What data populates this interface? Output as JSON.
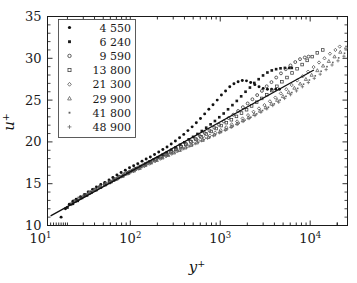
{
  "chart_data": {
    "type": "scatter",
    "title": "",
    "xlabel": "y+",
    "ylabel": "u+",
    "xscale": "log",
    "yscale": "linear",
    "xlim": [
      12,
      26000
    ],
    "ylim": [
      10,
      35
    ],
    "grid": false,
    "legend_position": "upper-left",
    "legend_title": "",
    "xticks": [
      10,
      100,
      1000,
      10000
    ],
    "xticklabels": [
      "10^1",
      "10^2",
      "10^3",
      "10^4"
    ],
    "yticks": [
      10,
      15,
      20,
      25,
      30,
      35
    ],
    "yticklabels": [
      "10",
      "15",
      "20",
      "25",
      "30",
      "35"
    ],
    "annotations": [
      {
        "name": "log-law-line",
        "description": "straight reference line",
        "x_start": 13,
        "y_start": 11.15,
        "x_end": 11000,
        "y_end": 28.6
      }
    ],
    "series": [
      {
        "name": "4 550",
        "marker": "filled-circle",
        "color": "#111111",
        "x": [
          17,
          19,
          21,
          23,
          25,
          28,
          31,
          34,
          38,
          42,
          47,
          52,
          58,
          64,
          71,
          79,
          88,
          98,
          109,
          121,
          135,
          150,
          167,
          186,
          207,
          230,
          256,
          285,
          317,
          353,
          393,
          437,
          487,
          542,
          603,
          671,
          747,
          831,
          925,
          1030,
          1146,
          1276,
          1420,
          1580,
          1759,
          1958,
          2179,
          2425,
          2699,
          3004,
          3344,
          3722,
          4143,
          4550
        ],
        "y": [
          11.0,
          12.0,
          12.55,
          12.9,
          13.15,
          13.45,
          13.7,
          14.0,
          14.3,
          14.6,
          14.9,
          15.15,
          15.45,
          15.75,
          16.05,
          16.35,
          16.6,
          16.9,
          17.15,
          17.4,
          17.7,
          17.95,
          18.2,
          18.5,
          18.8,
          19.1,
          19.4,
          19.75,
          20.1,
          20.5,
          20.9,
          21.35,
          21.8,
          22.3,
          22.8,
          23.35,
          23.9,
          24.45,
          25.0,
          25.6,
          26.1,
          26.6,
          26.95,
          27.2,
          27.35,
          27.3,
          27.1,
          26.85,
          26.6,
          26.4,
          26.3,
          26.3,
          26.3,
          26.3
        ]
      },
      {
        "name": "6 240",
        "marker": "filled-square",
        "color": "#1a1a1a",
        "x": [
          20,
          23,
          26,
          29,
          33,
          37,
          42,
          47,
          53,
          59,
          66,
          74,
          83,
          93,
          104,
          116,
          130,
          146,
          163,
          182,
          204,
          228,
          255,
          285,
          319,
          357,
          399,
          446,
          499,
          558,
          624,
          698,
          781,
          873,
          976,
          1092,
          1221,
          1366,
          1528,
          1709,
          1911,
          2138,
          2391,
          2674,
          2991,
          3345,
          3741,
          4184,
          4680,
          5234,
          5854,
          6240
        ],
        "y": [
          12.15,
          12.6,
          12.95,
          13.3,
          13.6,
          13.95,
          14.25,
          14.55,
          14.85,
          15.1,
          15.4,
          15.7,
          16.0,
          16.3,
          16.55,
          16.85,
          17.1,
          17.35,
          17.65,
          17.9,
          18.15,
          18.45,
          18.75,
          19.05,
          19.35,
          19.65,
          19.95,
          20.3,
          20.6,
          20.95,
          21.3,
          21.7,
          22.1,
          22.5,
          22.95,
          23.4,
          23.9,
          24.4,
          24.9,
          25.45,
          26.0,
          26.5,
          27.05,
          27.5,
          27.95,
          28.3,
          28.55,
          28.7,
          28.8,
          28.85,
          28.85,
          28.85
        ]
      },
      {
        "name": "9 590",
        "marker": "open-circle",
        "color": "#2b2b2b",
        "x": [
          22,
          25,
          28,
          32,
          36,
          41,
          46,
          52,
          59,
          66,
          75,
          85,
          96,
          108,
          122,
          138,
          156,
          176,
          199,
          225,
          254,
          287,
          324,
          366,
          413,
          467,
          527,
          596,
          673,
          760,
          859,
          970,
          1096,
          1238,
          1399,
          1580,
          1785,
          2017,
          2278,
          2574,
          2907,
          3284,
          3710,
          4191,
          4734,
          5348,
          6041,
          6824,
          7709,
          8708,
          9590
        ],
        "y": [
          12.55,
          12.95,
          13.3,
          13.65,
          13.95,
          14.3,
          14.6,
          14.9,
          15.2,
          15.5,
          15.8,
          16.1,
          16.35,
          16.65,
          16.95,
          17.2,
          17.5,
          17.75,
          18.05,
          18.3,
          18.6,
          18.9,
          19.2,
          19.5,
          19.8,
          20.1,
          20.4,
          20.7,
          21.05,
          21.35,
          21.7,
          22.05,
          22.45,
          22.85,
          23.25,
          23.7,
          24.15,
          24.6,
          25.1,
          25.6,
          26.1,
          26.65,
          27.15,
          27.7,
          28.2,
          28.7,
          29.15,
          29.55,
          29.9,
          30.1,
          30.2
        ]
      },
      {
        "name": "13 800",
        "marker": "open-square",
        "color": "#3a3a3a",
        "x": [
          24,
          27,
          31,
          35,
          40,
          46,
          52,
          59,
          68,
          77,
          88,
          100,
          114,
          130,
          148,
          168,
          191,
          218,
          248,
          282,
          321,
          365,
          415,
          473,
          538,
          612,
          697,
          793,
          902,
          1027,
          1169,
          1330,
          1514,
          1723,
          1961,
          2232,
          2540,
          2891,
          3290,
          3745,
          4262,
          4851,
          5521,
          6283,
          7151,
          8139,
          9264,
          10543,
          12000,
          13800
        ],
        "y": [
          12.9,
          13.25,
          13.6,
          13.95,
          14.3,
          14.6,
          14.95,
          15.25,
          15.55,
          15.85,
          16.15,
          16.45,
          16.75,
          17.05,
          17.35,
          17.6,
          17.9,
          18.2,
          18.5,
          18.8,
          19.1,
          19.4,
          19.7,
          20.0,
          20.3,
          20.6,
          20.95,
          21.25,
          21.6,
          21.95,
          22.3,
          22.65,
          23.05,
          23.45,
          23.85,
          24.3,
          24.75,
          25.2,
          25.65,
          26.15,
          26.65,
          27.2,
          27.7,
          28.25,
          28.75,
          29.25,
          29.75,
          30.2,
          30.65,
          31.0
        ]
      },
      {
        "name": "21 300",
        "marker": "open-diamond",
        "color": "#4a4a4a",
        "x": [
          27,
          31,
          36,
          41,
          47,
          54,
          62,
          71,
          82,
          94,
          108,
          124,
          143,
          164,
          189,
          217,
          250,
          287,
          330,
          380,
          437,
          503,
          578,
          665,
          765,
          880,
          1012,
          1164,
          1339,
          1540,
          1771,
          2037,
          2343,
          2695,
          3100,
          3565,
          4100,
          4715,
          5423,
          6236,
          7171,
          8247,
          9484,
          10907,
          12543,
          14424,
          16588,
          19076,
          21300
        ],
        "y": [
          13.2,
          13.6,
          13.95,
          14.3,
          14.6,
          14.95,
          15.25,
          15.55,
          15.9,
          16.2,
          16.5,
          16.8,
          17.1,
          17.4,
          17.7,
          18.0,
          18.3,
          18.6,
          18.9,
          19.2,
          19.5,
          19.8,
          20.1,
          20.45,
          20.75,
          21.1,
          21.4,
          21.75,
          22.1,
          22.45,
          22.8,
          23.2,
          23.6,
          24.0,
          24.4,
          24.85,
          25.3,
          25.8,
          26.3,
          26.8,
          27.35,
          27.85,
          28.4,
          28.95,
          29.5,
          30.0,
          30.55,
          31.0,
          31.4
        ]
      },
      {
        "name": "29 900",
        "marker": "open-triangle",
        "color": "#555555",
        "x": [
          30,
          35,
          40,
          46,
          53,
          61,
          71,
          82,
          95,
          110,
          127,
          147,
          170,
          197,
          228,
          264,
          306,
          354,
          410,
          475,
          550,
          637,
          738,
          855,
          990,
          1147,
          1328,
          1538,
          1781,
          2063,
          2389,
          2767,
          3205,
          3712,
          4299,
          4979,
          5766,
          6678,
          7734,
          8958,
          10375,
          12016,
          13917,
          16118,
          18668,
          21622,
          25044,
          29900
        ],
        "y": [
          13.5,
          13.9,
          14.25,
          14.6,
          14.95,
          15.25,
          15.6,
          15.9,
          16.25,
          16.55,
          16.85,
          17.2,
          17.5,
          17.8,
          18.1,
          18.4,
          18.7,
          19.0,
          19.3,
          19.6,
          19.9,
          20.2,
          20.55,
          20.85,
          21.2,
          21.5,
          21.85,
          22.2,
          22.55,
          22.9,
          23.3,
          23.7,
          24.1,
          24.55,
          25.0,
          25.45,
          25.95,
          26.45,
          26.95,
          27.5,
          28.0,
          28.55,
          29.1,
          29.65,
          30.2,
          30.75,
          31.3,
          32.1
        ]
      },
      {
        "name": "41 800",
        "marker": "small-dot",
        "color": "#606060",
        "x": [
          33,
          38,
          44,
          51,
          59,
          69,
          80,
          93,
          108,
          126,
          146,
          170,
          198,
          230,
          267,
          311,
          361,
          420,
          488,
          567,
          659,
          766,
          890,
          1034,
          1202,
          1396,
          1622,
          1885,
          2190,
          2544,
          2956,
          3434,
          3989,
          4634,
          5383,
          6254,
          7265,
          8440,
          9805,
          11391,
          13234,
          15375,
          17861,
          20749,
          24105,
          28004,
          32534,
          37796,
          41800
        ],
        "y": [
          13.75,
          14.15,
          14.5,
          14.9,
          15.2,
          15.55,
          15.9,
          16.2,
          16.55,
          16.85,
          17.2,
          17.5,
          17.8,
          18.1,
          18.4,
          18.7,
          19.0,
          19.3,
          19.6,
          19.95,
          20.25,
          20.55,
          20.9,
          21.2,
          21.55,
          21.9,
          22.25,
          22.6,
          22.95,
          23.35,
          23.75,
          24.15,
          24.55,
          25.0,
          25.45,
          25.9,
          26.4,
          26.9,
          27.4,
          27.9,
          28.45,
          29.0,
          29.5,
          30.05,
          30.6,
          31.15,
          31.7,
          32.3,
          32.7
        ]
      },
      {
        "name": "48 900",
        "marker": "plus",
        "color": "#6a6a6a",
        "x": [
          35,
          41,
          47,
          55,
          64,
          74,
          86,
          100,
          117,
          136,
          158,
          184,
          214,
          249,
          290,
          338,
          393,
          458,
          533,
          620,
          722,
          840,
          978,
          1138,
          1325,
          1542,
          1795,
          2089,
          2432,
          2831,
          3295,
          3835,
          4464,
          5196,
          6048,
          7040,
          8194,
          9538,
          11102,
          12922,
          15040,
          17505,
          20374,
          23715,
          27603,
          32128,
          37394,
          43522,
          48900
        ],
        "y": [
          13.95,
          14.35,
          14.7,
          15.1,
          15.4,
          15.75,
          16.1,
          16.4,
          16.75,
          17.05,
          17.4,
          17.7,
          18.0,
          18.3,
          18.6,
          18.9,
          19.2,
          19.5,
          19.8,
          20.15,
          20.45,
          20.75,
          21.1,
          21.4,
          21.75,
          22.1,
          22.45,
          22.8,
          23.15,
          23.55,
          23.95,
          24.35,
          24.75,
          25.2,
          25.65,
          26.1,
          26.6,
          27.1,
          27.6,
          28.1,
          28.65,
          29.2,
          29.7,
          30.25,
          30.8,
          31.35,
          31.9,
          32.5,
          33.1
        ]
      }
    ]
  },
  "axes": {
    "ylabel_base": "u",
    "ylabel_sup": "+",
    "xlabel_base": "y",
    "xlabel_sup": "+",
    "ytick_labels": [
      "35",
      "30",
      "25",
      "20",
      "15",
      "10"
    ],
    "xtick_mantissa": "10",
    "xtick_exponents": [
      "1",
      "2",
      "3",
      "4"
    ]
  },
  "legend": {
    "entries": [
      {
        "label": "4 550",
        "marker": "filled-circle"
      },
      {
        "label": "6 240",
        "marker": "filled-square"
      },
      {
        "label": "9 590",
        "marker": "open-circle"
      },
      {
        "label": "13 800",
        "marker": "open-square"
      },
      {
        "label": "21 300",
        "marker": "open-diamond"
      },
      {
        "label": "29 900",
        "marker": "open-triangle"
      },
      {
        "label": "41 800",
        "marker": "small-dot"
      },
      {
        "label": "48 900",
        "marker": "plus"
      }
    ]
  },
  "colors": {
    "axis": "#1a1a1a",
    "background": "#ffffff",
    "logline": "#101010"
  }
}
